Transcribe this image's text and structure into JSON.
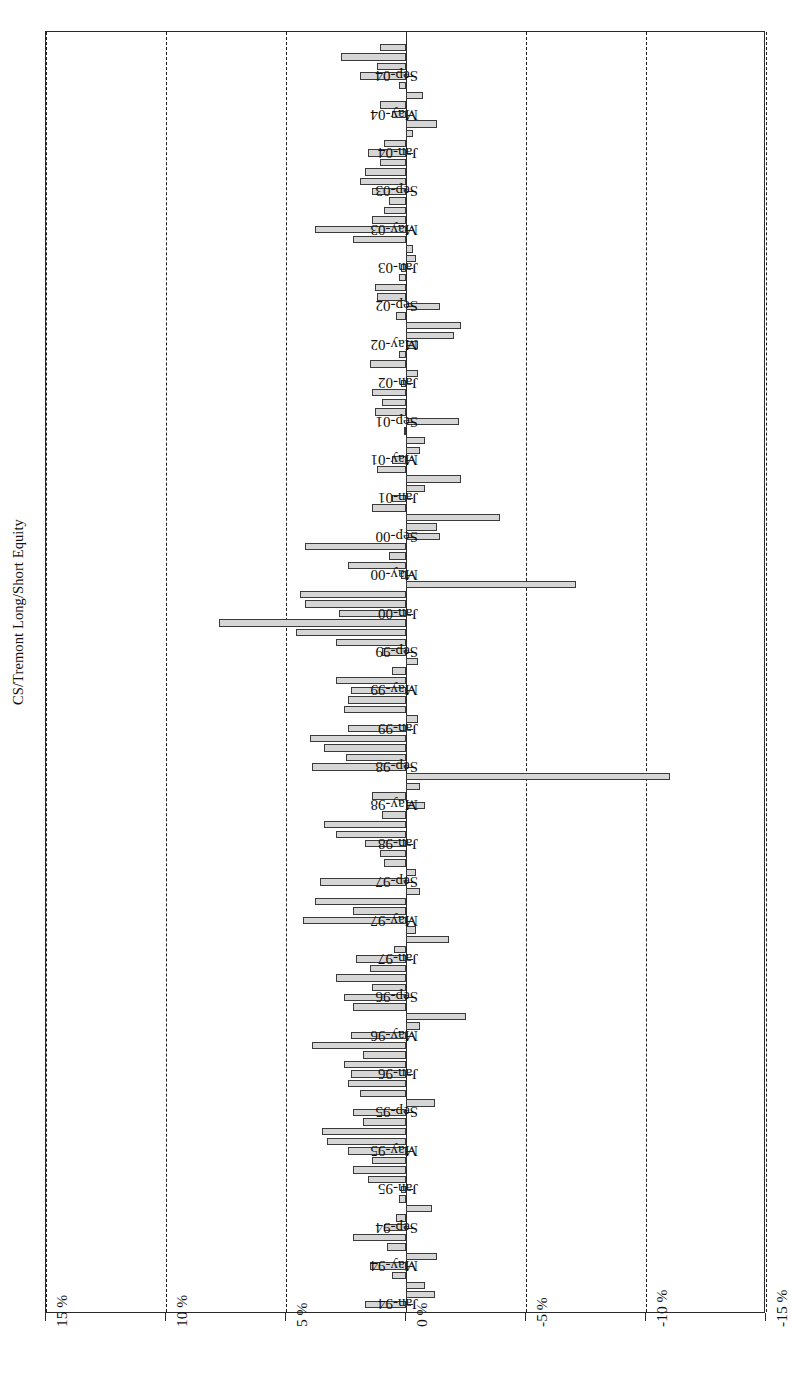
{
  "chart_data": {
    "type": "bar",
    "title": "CS/Tremont Long/Short Equity",
    "xlabel": "",
    "ylabel": "",
    "orientation": "horizontal-rotated-180",
    "grid": true,
    "legend": "none",
    "value_axis": {
      "ticks": [
        "15 %",
        "10 %",
        "5 %",
        "0 %",
        "-5 %",
        "-10 %",
        "-15 %"
      ],
      "tick_values": [
        15,
        10,
        5,
        0,
        -5,
        -10,
        -15
      ],
      "range": [
        -15,
        15
      ],
      "unit": "%"
    },
    "category_axis": {
      "labelled_ticks": [
        "Jan-94",
        "May-94",
        "Sep-94",
        "Jan-95",
        "May-95",
        "Sep-95",
        "Jan-96",
        "May-96",
        "Sep-96",
        "Jan-97",
        "May-97",
        "Sep-97",
        "Jan-98",
        "May-98",
        "Sep-98",
        "Jan-99",
        "May-99",
        "Sep-99",
        "Jan-00",
        "May-00",
        "Sep-00",
        "Jan-01",
        "May-01",
        "Sep-01",
        "Jan-02",
        "May-02",
        "Sep-02",
        "Jan-03",
        "May-03",
        "Sep-03",
        "Jan-04",
        "May-04",
        "Sep-04"
      ],
      "label_interval_months": 4
    },
    "categories": [
      "Jan-94",
      "Feb-94",
      "Mar-94",
      "Apr-94",
      "May-94",
      "Jun-94",
      "Jul-94",
      "Aug-94",
      "Sep-94",
      "Oct-94",
      "Nov-94",
      "Dec-94",
      "Jan-95",
      "Feb-95",
      "Mar-95",
      "Apr-95",
      "May-95",
      "Jun-95",
      "Jul-95",
      "Aug-95",
      "Sep-95",
      "Oct-95",
      "Nov-95",
      "Dec-95",
      "Jan-96",
      "Feb-96",
      "Mar-96",
      "Apr-96",
      "May-96",
      "Jun-96",
      "Jul-96",
      "Aug-96",
      "Sep-96",
      "Oct-96",
      "Nov-96",
      "Dec-96",
      "Jan-97",
      "Feb-97",
      "Mar-97",
      "Apr-97",
      "May-97",
      "Jun-97",
      "Jul-97",
      "Aug-97",
      "Sep-97",
      "Oct-97",
      "Nov-97",
      "Dec-97",
      "Jan-98",
      "Feb-98",
      "Mar-98",
      "Apr-98",
      "May-98",
      "Jun-98",
      "Jul-98",
      "Aug-98",
      "Sep-98",
      "Oct-98",
      "Nov-98",
      "Dec-98",
      "Jan-99",
      "Feb-99",
      "Mar-99",
      "Apr-99",
      "May-99",
      "Jun-99",
      "Jul-99",
      "Aug-99",
      "Sep-99",
      "Oct-99",
      "Nov-99",
      "Dec-99",
      "Jan-00",
      "Feb-00",
      "Mar-00",
      "Apr-00",
      "May-00",
      "Jun-00",
      "Jul-00",
      "Aug-00",
      "Sep-00",
      "Oct-00",
      "Nov-00",
      "Dec-00",
      "Jan-01",
      "Feb-01",
      "Mar-01",
      "Apr-01",
      "May-01",
      "Jun-01",
      "Jul-01",
      "Aug-01",
      "Sep-01",
      "Oct-01",
      "Nov-01",
      "Dec-01",
      "Jan-02",
      "Feb-02",
      "Mar-02",
      "Apr-02",
      "May-02",
      "Jun-02",
      "Jul-02",
      "Aug-02",
      "Sep-02",
      "Oct-02",
      "Nov-02",
      "Dec-02",
      "Jan-03",
      "Feb-03",
      "Mar-03",
      "Apr-03",
      "May-03",
      "Jun-03",
      "Jul-03",
      "Aug-03",
      "Sep-03",
      "Oct-03",
      "Nov-03",
      "Dec-03",
      "Jan-04",
      "Feb-04",
      "Mar-04",
      "Apr-04",
      "May-04",
      "Jun-04",
      "Jul-04",
      "Aug-04",
      "Sep-04",
      "Oct-04",
      "Nov-04",
      "Dec-04"
    ],
    "values": [
      1.7,
      -1.2,
      -0.8,
      0.6,
      1.5,
      -1.3,
      0.8,
      2.2,
      0.9,
      0.4,
      -1.1,
      0.3,
      0.2,
      1.6,
      2.2,
      1.4,
      2.4,
      3.3,
      3.5,
      1.8,
      2.2,
      -1.2,
      1.9,
      2.4,
      2.3,
      2.6,
      1.8,
      3.9,
      2.3,
      -0.6,
      -2.5,
      2.2,
      2.6,
      1.4,
      2.9,
      1.5,
      2.1,
      0.5,
      -1.8,
      -0.4,
      4.3,
      2.2,
      3.8,
      -0.6,
      3.6,
      -0.4,
      0.9,
      1.1,
      1.7,
      2.9,
      3.4,
      1.0,
      -0.8,
      1.4,
      -0.6,
      -11.0,
      3.9,
      2.5,
      3.4,
      4.0,
      2.4,
      -0.5,
      2.6,
      2.4,
      2.3,
      2.9,
      0.6,
      -0.5,
      1.0,
      2.9,
      4.6,
      7.8,
      2.8,
      4.2,
      4.4,
      -7.1,
      0.2,
      2.4,
      0.7,
      4.2,
      -1.4,
      -1.3,
      -3.9,
      1.4,
      0.6,
      -0.8,
      -2.3,
      1.2,
      0.6,
      -0.6,
      -0.8,
      0.1,
      -2.2,
      1.3,
      1.0,
      1.4,
      0.2,
      -0.5,
      1.5,
      0.3,
      -0.5,
      -2.0,
      -2.3,
      0.4,
      -1.4,
      1.2,
      1.3,
      0.3,
      0.2,
      -0.4,
      -0.3,
      2.2,
      3.8,
      1.4,
      0.9,
      0.7,
      1.4,
      1.9,
      1.7,
      1.1,
      1.6,
      0.9,
      -0.3,
      -1.3,
      0.6,
      1.1,
      -0.7,
      0.3,
      1.9,
      1.2,
      2.7,
      1.1
    ]
  }
}
